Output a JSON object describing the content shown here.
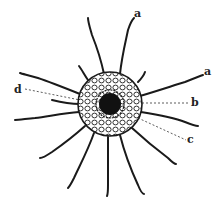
{
  "figure": {
    "colors": {
      "ink": "#1a1a1a",
      "background": "#ffffff"
    },
    "labels": [
      {
        "id": "a1",
        "text": "a",
        "x": 134,
        "y": 8
      },
      {
        "id": "a2",
        "text": "a",
        "x": 204,
        "y": 66
      },
      {
        "id": "b",
        "text": "b",
        "x": 191,
        "y": 97
      },
      {
        "id": "c",
        "text": "c",
        "x": 187,
        "y": 134
      },
      {
        "id": "d",
        "text": "d",
        "x": 14,
        "y": 84
      }
    ]
  }
}
